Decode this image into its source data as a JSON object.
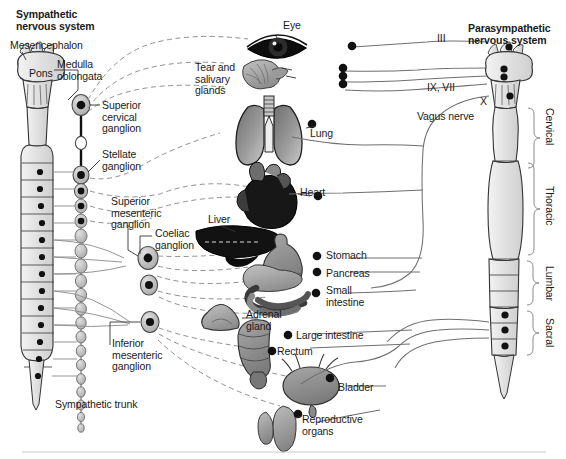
{
  "figure": {
    "title_left": "Sympathetic\nnervous system",
    "title_right": "Parasympathetic\nnervous system"
  },
  "left_labels": [
    {
      "name": "mesencephalon",
      "text": "Mesencephalon",
      "x": 10,
      "y": 40
    },
    {
      "name": "pons",
      "text": "Pons",
      "x": 29,
      "y": 68
    },
    {
      "name": "medulla-oblongata",
      "text": "Medulla\noblongata",
      "x": 57,
      "y": 59
    },
    {
      "name": "superior-cervical-ganglion",
      "text": "Superior\ncervical\nganglion",
      "x": 102,
      "y": 106
    },
    {
      "name": "stellate-ganglion",
      "text": "Stellate\nganglion",
      "x": 102,
      "y": 150
    },
    {
      "name": "superior-mesenteric-ganglion",
      "text": "Superior\nmesenteric\nganglion",
      "x": 111,
      "y": 199
    },
    {
      "name": "coeliac-ganglion",
      "text": "Coeliac\nganglion",
      "x": 155,
      "y": 229
    },
    {
      "name": "inferior-mesenteric-ganglion",
      "text": "Inferior\nmesenteric\nganglion",
      "x": 112,
      "y": 339
    },
    {
      "name": "sympathetic-trunk",
      "text": "Sympathetic trunk",
      "x": 55,
      "y": 400
    }
  ],
  "organ_labels": [
    {
      "name": "eye",
      "text": "Eye",
      "x": 283,
      "y": 21
    },
    {
      "name": "tear-and-salivary-glands",
      "text": "Tear and\nsalivary\nglands",
      "x": 195,
      "y": 64
    },
    {
      "name": "lung",
      "text": "Lung",
      "x": 309,
      "y": 128
    },
    {
      "name": "heart",
      "text": "Heart",
      "x": 300,
      "y": 190
    },
    {
      "name": "liver",
      "text": "Liver",
      "x": 209,
      "y": 215
    },
    {
      "name": "stomach",
      "text": "Stomach",
      "x": 326,
      "y": 253
    },
    {
      "name": "pancreas",
      "text": "Pancreas",
      "x": 326,
      "y": 272
    },
    {
      "name": "small-intestine",
      "text": "Small\nintestine",
      "x": 326,
      "y": 285
    },
    {
      "name": "adrenal-gland",
      "text": "Adrenal\ngland",
      "x": 246,
      "y": 310
    },
    {
      "name": "large-intestine",
      "text": "Large intestine",
      "x": 296,
      "y": 335
    },
    {
      "name": "rectum",
      "text": "Rectum",
      "x": 277,
      "y": 350
    },
    {
      "name": "bladder",
      "text": "Bladder",
      "x": 337,
      "y": 385
    },
    {
      "name": "reproductive-organs",
      "text": "Reproductive\norgans",
      "x": 302,
      "y": 420
    }
  ],
  "nerve_labels": [
    {
      "name": "cranial-nerve-iii",
      "text": "III",
      "x": 437,
      "y": 38
    },
    {
      "name": "cranial-nerves-ix-vii",
      "text": "IX, VII",
      "x": 429,
      "y": 84
    },
    {
      "name": "cranial-nerve-x",
      "text": "X",
      "x": 480,
      "y": 98
    },
    {
      "name": "vagus-nerve",
      "text": "Vagus nerve",
      "x": 417,
      "y": 114
    }
  ],
  "spinal_regions": [
    {
      "name": "cervical",
      "text": "Cervical",
      "x": 543,
      "y": 103,
      "height": 58
    },
    {
      "name": "thoracic",
      "text": "Thoracic",
      "x": 543,
      "y": 190,
      "height": 90
    },
    {
      "name": "lumbar",
      "text": "Lumbar",
      "x": 543,
      "y": 303,
      "height": 52
    },
    {
      "name": "sacral",
      "text": "Sacral",
      "x": 543,
      "y": 365,
      "height": 50
    }
  ],
  "colors": {
    "ink": "#1a1a1a",
    "nerve_line": "#5a5a5a",
    "dashed_line": "#8a8a8a",
    "cord_fill": "#e9e9e9",
    "cord_stroke": "#4d4d4d",
    "ganglion_fill": "#bdbdbd",
    "ganglion_core": "#111111",
    "organ_mid": "#8d8d8d",
    "organ_dark": "#3a3a3a",
    "organ_light": "#c9c9c9",
    "liver_black": "#121212",
    "heart_black": "#171717",
    "footer_rule": "#bfbfbf"
  }
}
